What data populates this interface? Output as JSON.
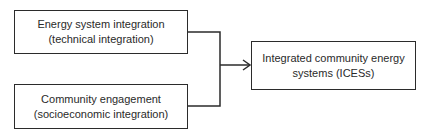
{
  "diagram": {
    "type": "flow",
    "nodes": [
      {
        "id": "energy-system-integration",
        "line1": "Energy system integration",
        "line2": "(technical integration)"
      },
      {
        "id": "community-engagement",
        "line1": "Community engagement",
        "line2": "(socioeconomic integration)"
      },
      {
        "id": "icess",
        "line1": "Integrated community energy",
        "line2": "systems (ICESs)"
      }
    ],
    "edges": [
      {
        "from": "energy-system-integration",
        "to": "icess"
      },
      {
        "from": "community-engagement",
        "to": "icess"
      }
    ],
    "colors": {
      "stroke": "#2b2b2b",
      "text": "#2a2a2a",
      "background": "#ffffff"
    }
  }
}
